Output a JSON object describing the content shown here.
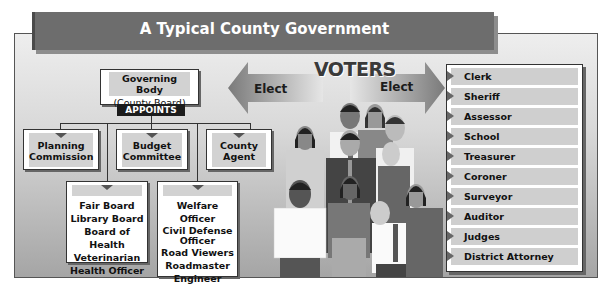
{
  "title": "A Typical County Government",
  "governing_body": {
    "line1": "Governing Body",
    "line2": "(County Board)",
    "action": "APPOINTS"
  },
  "appointed_top": [
    {
      "label_line1": "Planning",
      "label_line2": "Commission"
    },
    {
      "label_line1": "Budget",
      "label_line2": "Committee"
    },
    {
      "label_line1": "County",
      "label_line2": "Agent"
    }
  ],
  "appointed_group1": [
    "Fair Board",
    "Library Board",
    "Board of Health",
    "Veterinarian",
    "Health Officer"
  ],
  "appointed_group2": [
    "Welfare Officer",
    "Civil Defense",
    "Officer",
    "Road Viewers",
    "Roadmaster",
    "Engineer"
  ],
  "voters": {
    "label": "VOTERS",
    "elect_left": "Elect",
    "elect_right": "Elect"
  },
  "elected_officials": [
    "Clerk",
    "Sheriff",
    "Assessor",
    "School Superintendent",
    "Treasurer",
    "Coroner",
    "Surveyor",
    "Auditor",
    "Judges",
    "District Attorney"
  ],
  "colors": {
    "title_bar": "#6d6d6d",
    "appoints_bg": "#1c1c1c",
    "label_band": "#d2d2d2",
    "frame_top": "#eeeeee",
    "frame_bottom": "#a5a5a5"
  }
}
